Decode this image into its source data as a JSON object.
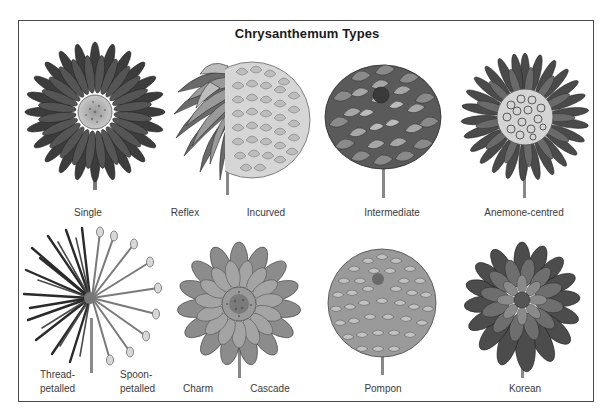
{
  "title": "Chrysanthemum Types",
  "rows": [
    {
      "items": [
        {
          "id": "single",
          "labels": [
            "Single"
          ]
        },
        {
          "id": "reflex",
          "labels": [
            "Reflex"
          ]
        },
        {
          "id": "incurved",
          "labels": [
            "Incurved"
          ]
        },
        {
          "id": "intermediate",
          "labels": [
            "Intermediate"
          ]
        },
        {
          "id": "anemone-centred",
          "labels": [
            "Anemone-centred"
          ]
        }
      ]
    },
    {
      "items": [
        {
          "id": "thread-petalled",
          "labels": [
            "Thread-",
            "petalled"
          ]
        },
        {
          "id": "spoon-petalled",
          "labels": [
            "Spoon-",
            "petalled"
          ]
        },
        {
          "id": "charm",
          "labels": [
            "Charm"
          ]
        },
        {
          "id": "cascade",
          "labels": [
            "Cascade"
          ]
        },
        {
          "id": "pompon",
          "labels": [
            "Pompon"
          ]
        },
        {
          "id": "korean",
          "labels": [
            "Korean"
          ]
        }
      ]
    }
  ],
  "colors": {
    "frame": "#4a4a4a",
    "ink_dark": "#2e2e2e",
    "ink_mid": "#6a6a6a",
    "ink_light": "#a8a8a8",
    "paper": "#ffffff"
  }
}
